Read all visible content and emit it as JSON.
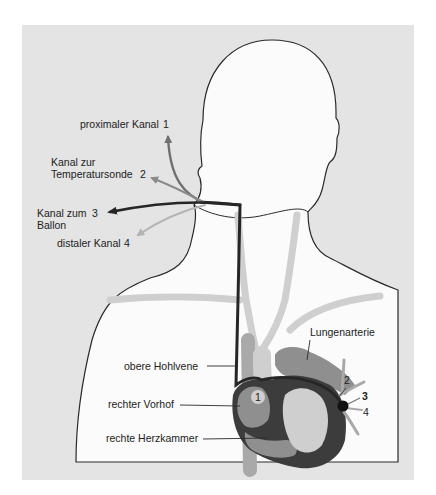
{
  "diagram": {
    "colors": {
      "panel": "#e4e4e4",
      "body": "#fbfbfb",
      "outline": "#2a2a2a",
      "vessel_light": "#cfcfcf",
      "vessel_mid": "#a9a9a9",
      "heart_mid": "#8f8f8f",
      "heart_dark": "#3c3c3c",
      "channel_1": "#6f6f6f",
      "channel_2": "#8a8a8a",
      "channel_3": "#262626",
      "channel_4": "#b3b3b3",
      "balloon": "#111111"
    },
    "channels": [
      {
        "id": "1",
        "label": "proximaler Kanal",
        "number": "1"
      },
      {
        "id": "2",
        "label_line1": "Kanal zur",
        "label_line2": "Temperatursonde",
        "number": "2"
      },
      {
        "id": "3",
        "label_line1": "Kanal zum",
        "label_line2": "Ballon",
        "number": "3"
      },
      {
        "id": "4",
        "label": "distaler Kanal",
        "number": "4"
      }
    ],
    "anatomy_labels": {
      "pulmonary_artery": "Lungenarterie",
      "superior_vena_cava": "obere Hohlvene",
      "right_atrium": "rechter Vorhof",
      "right_ventricle": "rechte Herzkammer"
    },
    "markers": {
      "atrium_port": "1",
      "tip_2": "2",
      "tip_3": "3",
      "tip_4": "4"
    }
  }
}
